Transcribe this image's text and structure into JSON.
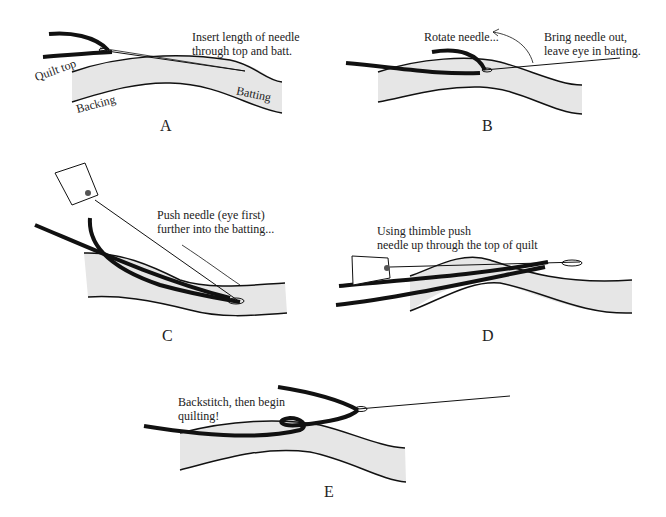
{
  "panels": [
    {
      "id": "A",
      "label": "A",
      "caption": "Insert length of needle\nthrough top and batt.",
      "tags": {
        "quilt_top": "Quilt top",
        "backing": "Backing",
        "batting": "Batting"
      }
    },
    {
      "id": "B",
      "label": "B",
      "caption_left": "Rotate needle...",
      "caption_right": "Bring needle out,\nleave eye in batting."
    },
    {
      "id": "C",
      "label": "C",
      "caption": "Push needle (eye first)\nfurther into the batting..."
    },
    {
      "id": "D",
      "label": "D",
      "caption": "Using thimble push\nneedle up through the top of quilt"
    },
    {
      "id": "E",
      "label": "E",
      "caption": "Backstitch, then begin\nquilting!"
    }
  ],
  "colors": {
    "ink": "#111111",
    "batting": "#e6e6e6"
  }
}
